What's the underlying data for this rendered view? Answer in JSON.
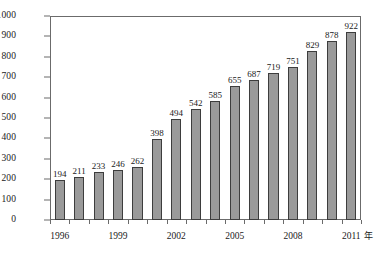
{
  "chart_data": {
    "type": "bar",
    "title": "",
    "subtitle": "",
    "xlabel": "年",
    "ylabel": "亿 kWh",
    "ylim": [
      0,
      1000
    ],
    "ytick_step": 100,
    "grid": false,
    "legend": null,
    "bar_color": "#9a9a9a",
    "bar_border_color": "#3d3d3d",
    "frame_color": "#6b6b6b",
    "background": "#ffffff",
    "categories": [
      "1996",
      "1997",
      "1998",
      "1999",
      "2000",
      "2001",
      "2002",
      "2003",
      "2004",
      "2005",
      "2006",
      "2007",
      "2008",
      "2009",
      "2010",
      "2011"
    ],
    "values": [
      194,
      211,
      233,
      246,
      262,
      398,
      494,
      542,
      585,
      655,
      687,
      719,
      751,
      829,
      878,
      922
    ],
    "data_labels": [
      "194",
      "211",
      "233",
      "246",
      "262",
      "398",
      "494",
      "542",
      "585",
      "655",
      "687",
      "719",
      "751",
      "829",
      "878",
      "922"
    ],
    "ytick_labels": [
      "0",
      "100",
      "200",
      "300",
      "400",
      "500",
      "600",
      "700",
      "800",
      "900",
      "1000"
    ],
    "ytick_values": [
      0,
      100,
      200,
      300,
      400,
      500,
      600,
      700,
      800,
      900,
      1000
    ],
    "xtick_labels": [
      "1996",
      "1999",
      "2002",
      "2005",
      "2008",
      "2011"
    ],
    "xtick_label_indices": [
      0,
      3,
      6,
      9,
      12,
      15
    ]
  }
}
